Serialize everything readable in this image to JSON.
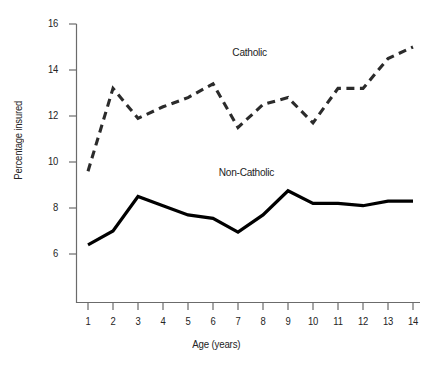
{
  "chart_data": {
    "type": "line",
    "title": "",
    "subtitle": "",
    "xlabel": "Age (years)",
    "ylabel": "Percentage insured",
    "x": [
      1,
      2,
      3,
      4,
      5,
      6,
      7,
      8,
      9,
      10,
      11,
      12,
      13,
      14
    ],
    "xticklabels": [
      "1",
      "2",
      "3",
      "4",
      "5",
      "6",
      "7",
      "8",
      "9",
      "10",
      "11",
      "12",
      "13",
      "14"
    ],
    "yticklabels": [
      "6",
      "8",
      "10",
      "12",
      "14",
      "16"
    ],
    "yticks": [
      6,
      8,
      10,
      12,
      14,
      16
    ],
    "xlim": [
      0.6,
      14.4
    ],
    "ylim": [
      4.0,
      16.0
    ],
    "grid": false,
    "legend": "inline-annotations",
    "series": [
      {
        "name": "Catholic",
        "style": "dashed",
        "color": "#2b2b2b",
        "values": [
          9.6,
          13.2,
          11.9,
          12.4,
          12.8,
          13.4,
          11.5,
          12.5,
          12.8,
          11.7,
          13.2,
          13.2,
          14.5,
          15.0
        ]
      },
      {
        "name": "Non-Catholic",
        "style": "solid",
        "color": "#000000",
        "values": [
          6.4,
          7.0,
          8.5,
          8.1,
          7.7,
          7.55,
          6.95,
          7.7,
          8.75,
          8.2,
          8.2,
          8.1,
          8.3,
          8.3
        ]
      }
    ],
    "annotations": [
      {
        "text": "Catholic",
        "x": 8.0,
        "y": 14.4
      },
      {
        "text": "Non-Catholic",
        "x": 7.8,
        "y": 9.3
      }
    ]
  },
  "axes": {
    "y_tick_0": "6",
    "y_tick_1": "8",
    "y_tick_2": "10",
    "y_tick_3": "12",
    "y_tick_4": "14",
    "y_tick_5": "16",
    "x_tick_0": "1",
    "x_tick_1": "2",
    "x_tick_2": "3",
    "x_tick_3": "4",
    "x_tick_4": "5",
    "x_tick_5": "6",
    "x_tick_6": "7",
    "x_tick_7": "8",
    "x_tick_8": "9",
    "x_tick_9": "10",
    "x_tick_10": "11",
    "x_tick_11": "12",
    "x_tick_12": "13",
    "x_tick_13": "14",
    "x_title": "Age (years)",
    "y_title": "Percentage insured"
  },
  "labels": {
    "catholic": "Catholic",
    "non_catholic": "Non-Catholic"
  },
  "colors": {
    "axis": "#6b6b6b",
    "catholic_line": "#2b2b2b",
    "non_catholic_line": "#000000",
    "text": "#242424",
    "background": "#ffffff"
  }
}
